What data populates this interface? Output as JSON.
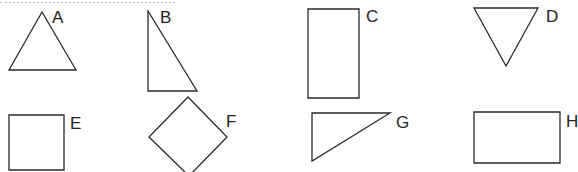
{
  "figure": {
    "stroke_color": "#2a2a2a",
    "background": "#ffffff",
    "top_text_cutoff": true
  },
  "shapes": [
    {
      "label": "A",
      "kind": "triangle",
      "points": "42,12 9,70 76,70",
      "label_pos": [
        52,
        9
      ]
    },
    {
      "label": "B",
      "kind": "right-triangle",
      "points": "148,11 148,91 197,91",
      "label_pos": [
        160,
        9
      ]
    },
    {
      "label": "C",
      "kind": "rectangle",
      "points": "308,9 359,9 359,98 308,98",
      "label_pos": [
        366,
        8
      ]
    },
    {
      "label": "D",
      "kind": "inverted-triangle",
      "points": "474,8 538,8 506,66",
      "label_pos": [
        546,
        8
      ]
    },
    {
      "label": "E",
      "kind": "square",
      "points": "9,115 64,115 64,170 9,170",
      "label_pos": [
        70,
        115
      ]
    },
    {
      "label": "F",
      "kind": "diamond",
      "points": "188,97 227,137 189,176 149,137",
      "label_pos": [
        226,
        113
      ]
    },
    {
      "label": "G",
      "kind": "right-triangle",
      "points": "312,113 390,113 312,161",
      "label_pos": [
        396,
        114
      ]
    },
    {
      "label": "H",
      "kind": "rectangle",
      "points": "474,112 560,112 560,163 474,163",
      "label_pos": [
        566,
        113
      ]
    }
  ]
}
